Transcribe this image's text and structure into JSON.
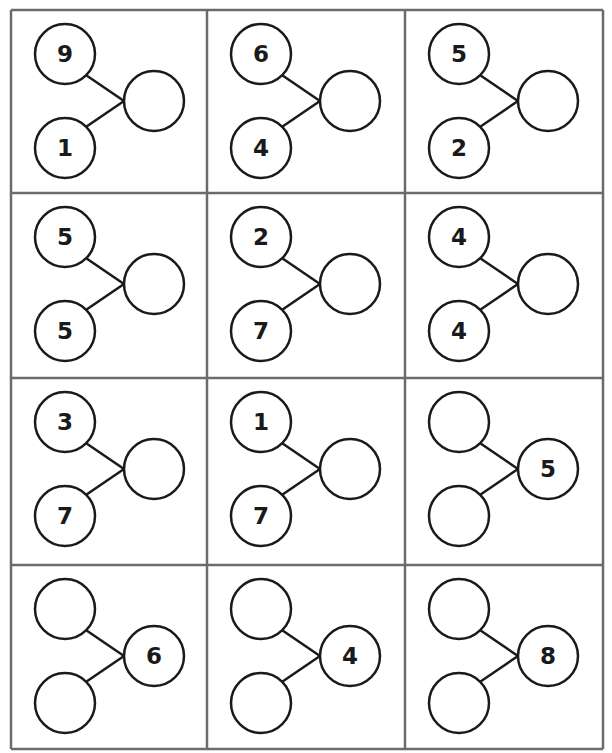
{
  "worksheet": {
    "title": "",
    "grid": {
      "rows": 4,
      "cols": 3
    },
    "colors": {
      "grid_line": "#6b6b6b",
      "circle_stroke": "#1a1a1a",
      "background": "#ffffff"
    },
    "cells": [
      {
        "top": "9",
        "bottom": "1",
        "whole": ""
      },
      {
        "top": "6",
        "bottom": "4",
        "whole": ""
      },
      {
        "top": "5",
        "bottom": "2",
        "whole": ""
      },
      {
        "top": "5",
        "bottom": "5",
        "whole": ""
      },
      {
        "top": "2",
        "bottom": "7",
        "whole": ""
      },
      {
        "top": "4",
        "bottom": "4",
        "whole": ""
      },
      {
        "top": "3",
        "bottom": "7",
        "whole": ""
      },
      {
        "top": "1",
        "bottom": "7",
        "whole": ""
      },
      {
        "top": "",
        "bottom": "",
        "whole": "5"
      },
      {
        "top": "",
        "bottom": "",
        "whole": "6"
      },
      {
        "top": "",
        "bottom": "",
        "whole": "4"
      },
      {
        "top": "",
        "bottom": "",
        "whole": "8"
      }
    ]
  }
}
